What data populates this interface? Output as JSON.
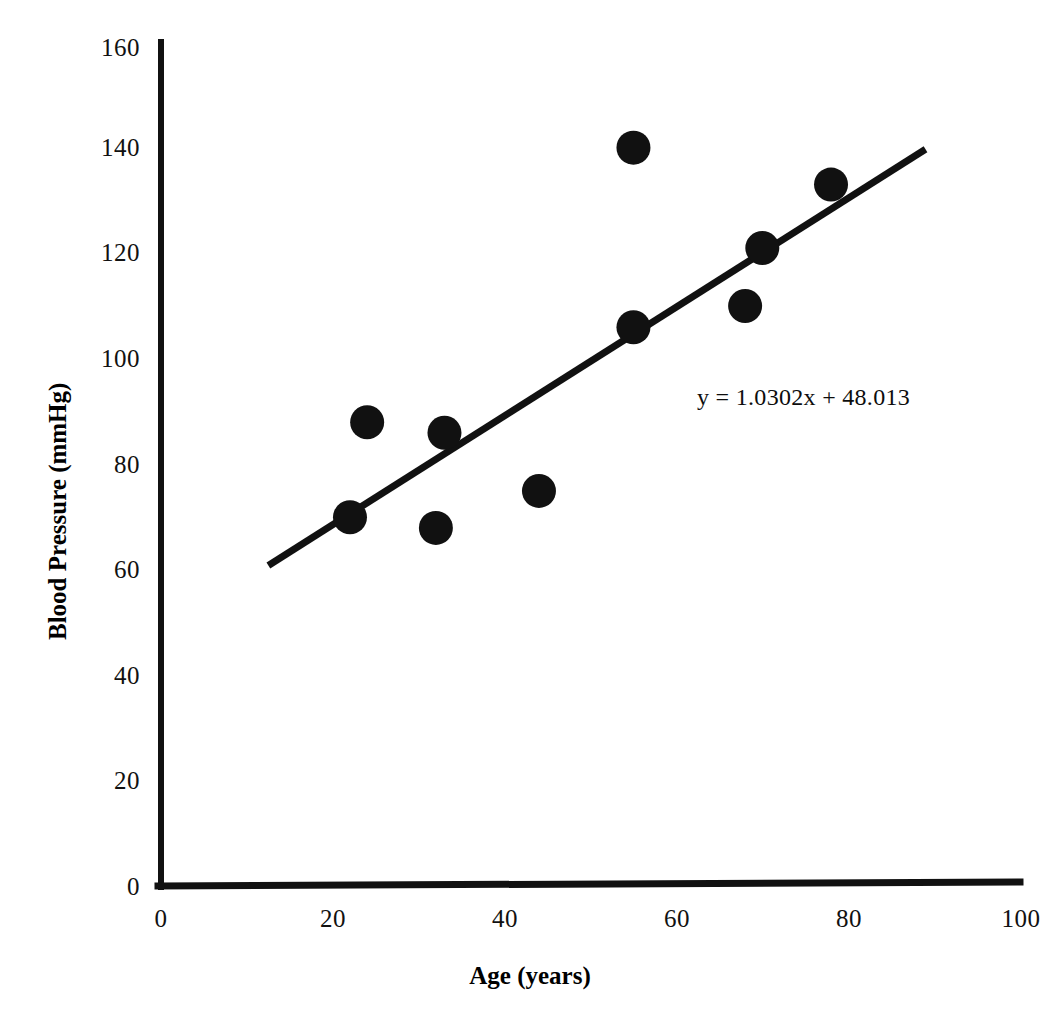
{
  "chart_data": {
    "type": "scatter",
    "title": "",
    "xlabel": "Age (years)",
    "ylabel": "Blood Pressure (mmHg)",
    "xlim": [
      0,
      100
    ],
    "ylim": [
      0,
      160
    ],
    "xticks": [
      "0",
      "20",
      "40",
      "60",
      "80",
      "100"
    ],
    "yticks": [
      "0",
      "20",
      "40",
      "60",
      "80",
      "100",
      "120",
      "140",
      "160"
    ],
    "grid": false,
    "legend": "none",
    "marker_color": "#111111",
    "marker_shape": "circle",
    "series": [
      {
        "name": "Blood Pressure vs Age",
        "x": [
          22,
          24,
          32,
          33,
          44,
          55,
          55,
          68,
          70,
          78
        ],
        "y": [
          70,
          88,
          68,
          86,
          75,
          106,
          140,
          110,
          121,
          133
        ]
      }
    ],
    "trendline": {
      "equation": "y = 1.0302x + 48.013",
      "slope": 1.0302,
      "intercept": 48.013,
      "x_start": 12.5,
      "x_end": 89,
      "color": "#111111"
    },
    "annotations": [
      {
        "name": "trendline-equation",
        "text": "y = 1.0302x + 48.013",
        "x": 63,
        "y": 97
      }
    ]
  },
  "axes": {
    "x_title": "Age (years)",
    "y_title": "Blood Pressure (mmHg)",
    "x_tick_labels": [
      "0",
      "20",
      "40",
      "60",
      "80",
      "100"
    ],
    "y_tick_labels": [
      "0",
      "20",
      "40",
      "60",
      "80",
      "100",
      "120",
      "140",
      "160"
    ]
  },
  "equation": {
    "text": "y = 1.0302x + 48.013"
  }
}
